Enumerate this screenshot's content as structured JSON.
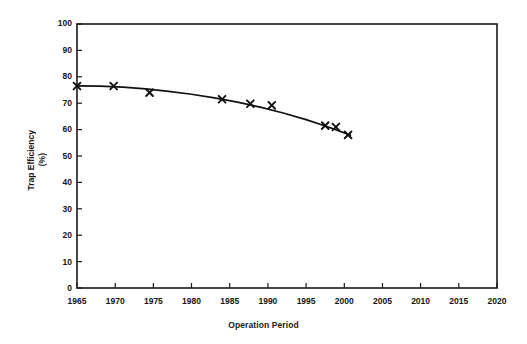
{
  "chart_data": {
    "type": "line",
    "title": "",
    "xlabel": "Operation Period",
    "ylabel_line1": "Trap Efficiency",
    "ylabel_line2": "(%)",
    "xlim": [
      1965,
      2020
    ],
    "ylim": [
      0,
      100
    ],
    "xticks": [
      1965,
      1970,
      1975,
      1980,
      1985,
      1990,
      1995,
      2000,
      2005,
      2010,
      2015,
      2020
    ],
    "yticks": [
      0,
      10,
      20,
      30,
      40,
      50,
      60,
      70,
      80,
      90,
      100
    ],
    "grid": false,
    "legend": "none",
    "marker": "x-cross",
    "line_color": "#111111",
    "marker_color": "#111111",
    "axis_color": "#1a1a1a",
    "background_color": "#ffffff",
    "series": [
      {
        "name": "Trap Efficiency",
        "x": [
          1965.0,
          1969.8,
          1974.5,
          1984.0,
          1987.7,
          1990.5,
          1997.5,
          1998.9,
          2000.5
        ],
        "values": [
          76.5,
          76.5,
          74.0,
          71.5,
          69.8,
          69.2,
          61.5,
          61.0,
          58.0
        ]
      }
    ],
    "fit_curve": {
      "name": "fitted-trend",
      "x": [
        1965.0,
        1968.0,
        1971.0,
        1974.0,
        1977.0,
        1980.0,
        1983.0,
        1986.0,
        1989.0,
        1992.0,
        1995.0,
        1998.0,
        2000.8
      ],
      "values": [
        76.6,
        76.5,
        76.1,
        75.4,
        74.5,
        73.4,
        72.0,
        70.4,
        68.5,
        66.3,
        63.8,
        60.9,
        57.9
      ]
    }
  }
}
